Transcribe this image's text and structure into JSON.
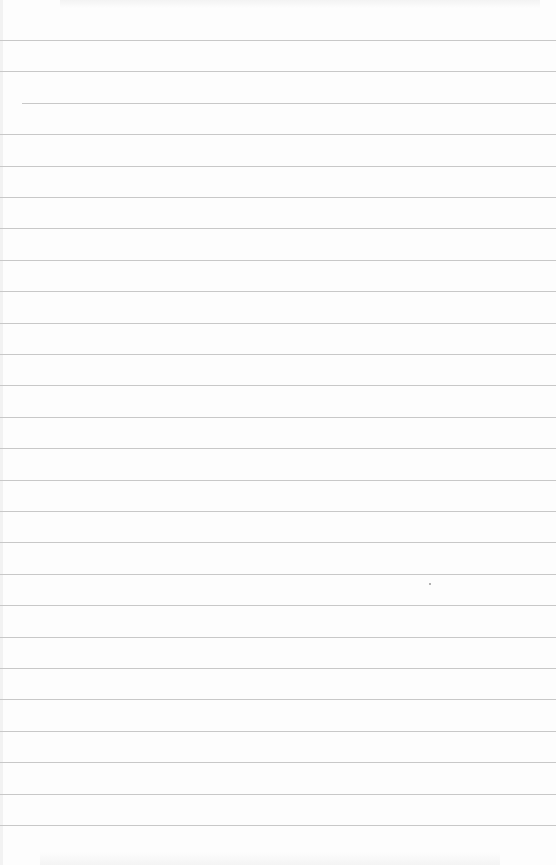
{
  "page": {
    "type": "lined paper",
    "background_color": "#fdfdfd",
    "rule_color": "#c8c8c8",
    "rule_count": 26,
    "first_rule_y": 40,
    "rule_spacing": 31.4
  }
}
